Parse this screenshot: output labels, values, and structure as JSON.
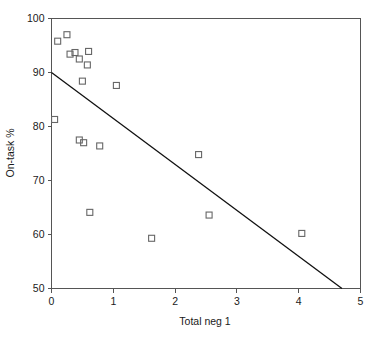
{
  "chart_data": {
    "type": "scatter",
    "title": "",
    "xlabel": "Total neg 1",
    "ylabel": "On-task %",
    "xlim": [
      0,
      5
    ],
    "ylim": [
      50,
      100
    ],
    "xticks": [
      0,
      1,
      2,
      3,
      4,
      5
    ],
    "yticks": [
      50,
      60,
      70,
      80,
      90,
      100
    ],
    "xtick_labels": [
      "0",
      "1",
      "2",
      "3",
      "4",
      "5"
    ],
    "ytick_labels": [
      "50",
      "60",
      "70",
      "80",
      "90",
      "100"
    ],
    "grid": false,
    "legend": false,
    "marker": "open-square",
    "marker_color": "#666666",
    "line_color": "#111111",
    "points": [
      {
        "x": 0.1,
        "y": 95.8
      },
      {
        "x": 0.25,
        "y": 97.0
      },
      {
        "x": 0.3,
        "y": 93.4
      },
      {
        "x": 0.38,
        "y": 93.7
      },
      {
        "x": 0.45,
        "y": 92.5
      },
      {
        "x": 0.6,
        "y": 93.9
      },
      {
        "x": 0.58,
        "y": 91.4
      },
      {
        "x": 0.05,
        "y": 81.3
      },
      {
        "x": 0.5,
        "y": 88.4
      },
      {
        "x": 1.05,
        "y": 87.6
      },
      {
        "x": 0.45,
        "y": 77.5
      },
      {
        "x": 0.52,
        "y": 77.0
      },
      {
        "x": 0.78,
        "y": 76.4
      },
      {
        "x": 0.62,
        "y": 64.1
      },
      {
        "x": 1.62,
        "y": 59.3
      },
      {
        "x": 2.38,
        "y": 74.8
      },
      {
        "x": 2.55,
        "y": 63.6
      },
      {
        "x": 4.05,
        "y": 60.2
      }
    ],
    "fit_line": {
      "x0": 0.0,
      "y0": 90.0,
      "x1": 4.7,
      "y1": 50.0
    }
  }
}
